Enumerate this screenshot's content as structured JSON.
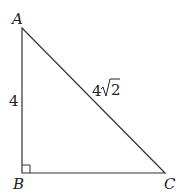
{
  "diagram": {
    "type": "right-triangle",
    "vertices": [
      {
        "name": "A",
        "x": 22,
        "y": 28
      },
      {
        "name": "B",
        "x": 22,
        "y": 173
      },
      {
        "name": "C",
        "x": 165,
        "y": 173
      }
    ],
    "right_angle_at": "B",
    "side_labels": {
      "AB": "4",
      "AC_coef": "4",
      "AC_radicand": "2"
    },
    "colors": {
      "stroke": "#333333",
      "text": "#222222"
    }
  }
}
